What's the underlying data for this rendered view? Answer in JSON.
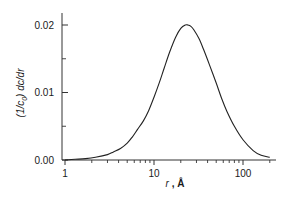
{
  "chart_data": {
    "type": "line",
    "title": "",
    "xlabel": "r , Å",
    "ylabel": "(1/c0) dc/dr",
    "x_scale": "log",
    "xlim": [
      0.9,
      220
    ],
    "ylim": [
      0.0,
      0.0225
    ],
    "grid": false,
    "legend": null,
    "x_ticks": [
      {
        "value": 1,
        "label": "1"
      },
      {
        "value": 10,
        "label": "10"
      },
      {
        "value": 100,
        "label": "100"
      }
    ],
    "x_minor_ticks": [
      2,
      3,
      4,
      5,
      6,
      7,
      8,
      9,
      20,
      30,
      40,
      50,
      60,
      70,
      80,
      90,
      200
    ],
    "y_ticks": [
      {
        "value": 0.0,
        "label": "0.00"
      },
      {
        "value": 0.01,
        "label": "0.01"
      },
      {
        "value": 0.02,
        "label": "0.02"
      }
    ],
    "y_minor_ticks": [
      0.005,
      0.015
    ],
    "series": [
      {
        "name": "distribution",
        "color": "#222222",
        "x": [
          1.0,
          1.3,
          1.7,
          2.2,
          3.0,
          3.5,
          4.2,
          5.0,
          5.7,
          6.5,
          7.6,
          8.7,
          10.0,
          11.5,
          13.0,
          15.0,
          17.5,
          20.0,
          22.5,
          24.0,
          26.0,
          28.0,
          32.0,
          36.0,
          42.0,
          50.0,
          58.0,
          66.0,
          80.0,
          100.0,
          130.0,
          160.0,
          200.0
        ],
        "y": [
          0.0,
          0.0001,
          0.0002,
          0.0004,
          0.0008,
          0.0012,
          0.0017,
          0.0025,
          0.0034,
          0.0045,
          0.0058,
          0.0073,
          0.0093,
          0.0115,
          0.0136,
          0.016,
          0.0182,
          0.0195,
          0.02,
          0.02,
          0.0198,
          0.0193,
          0.018,
          0.0164,
          0.0141,
          0.0114,
          0.009,
          0.0072,
          0.005,
          0.003,
          0.0014,
          0.0007,
          0.0004
        ]
      }
    ]
  },
  "axes": {
    "y_label_main": "(1/c",
    "y_label_sub": "0",
    "y_label_tail": ") dc/dr",
    "x_label_var": "r",
    "x_label_unit": ", Å"
  }
}
